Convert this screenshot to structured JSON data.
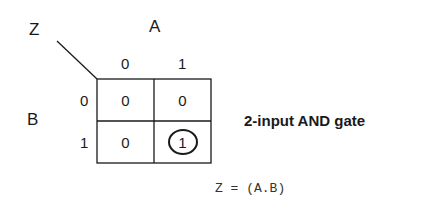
{
  "kmap": {
    "output_label": "Z",
    "col_variable": "A",
    "row_variable": "B",
    "col_headers": [
      "0",
      "1"
    ],
    "row_headers": [
      "0",
      "1"
    ],
    "cells": [
      [
        "0",
        "0"
      ],
      [
        "0",
        "1"
      ]
    ],
    "circled_cell": {
      "row": 1,
      "col": 1
    }
  },
  "title": "2-input AND gate",
  "expression": "Z = (A.B)",
  "colors": {
    "ink": "#1a1a1a",
    "background": "#ffffff"
  }
}
